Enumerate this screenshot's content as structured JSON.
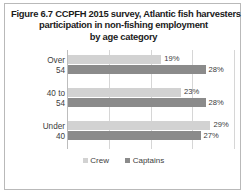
{
  "figure": {
    "title_lines": [
      "Figure 6.7 CCPFH 2015 survey, Atlantic fish harvesters",
      "participation in non-fishing employment",
      "by age category"
    ],
    "border_color": "#b9b9b9"
  },
  "chart_data": {
    "type": "bar",
    "orientation": "horizontal",
    "title": "Figure 6.7 CCPFH 2015 survey, Atlantic fish harvesters participation in non-fishing employment by age category",
    "xlabel": "",
    "ylabel": "",
    "categories": [
      "Over 54",
      "40 to 54",
      "Under 40"
    ],
    "category_lines": [
      [
        "Over",
        "54"
      ],
      [
        "40 to",
        "54"
      ],
      [
        "Under",
        "40"
      ]
    ],
    "series": [
      {
        "name": "Crew",
        "color": "#d2d2d2",
        "values": [
          19,
          23,
          29
        ],
        "labels": [
          "19%",
          "23%",
          "29%"
        ]
      },
      {
        "name": "Captains",
        "color": "#8b8b8b",
        "values": [
          28,
          28,
          27
        ],
        "labels": [
          "28%",
          "28%",
          "27%"
        ]
      }
    ],
    "value_suffix": "%",
    "xlim": [
      0,
      34
    ],
    "grid": true,
    "gridline_values": [
      8.5,
      17,
      25.5,
      34
    ],
    "x_tick_labels_visible": false,
    "legend_position": "bottom"
  }
}
